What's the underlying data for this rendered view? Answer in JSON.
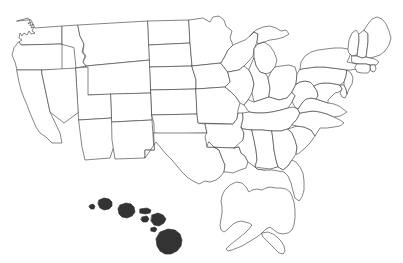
{
  "map": {
    "title": "United States Choropleth Map",
    "projection": "albers-usa",
    "background_color": "#ffffff",
    "border_color": "#3a3a3a",
    "default_fill": "#ffffff",
    "legend_visible": false,
    "labels_visible": false,
    "shade_levels": {
      "none": "#ffffff",
      "gray": "#999999",
      "dark": "#333333"
    },
    "highlighted_states": [
      {
        "code": "HI",
        "name": "Hawaii",
        "shade": "dark"
      },
      {
        "code": "NH",
        "name": "New Hampshire",
        "shade": "dark"
      },
      {
        "code": "WV",
        "name": "West Virginia",
        "shade": "gray"
      },
      {
        "code": "TN",
        "name": "Tennessee",
        "shade": "gray"
      },
      {
        "code": "AR",
        "name": "Arkansas",
        "shade": "gray"
      }
    ],
    "states": [
      {
        "code": "WA",
        "name": "Washington",
        "shade": "none"
      },
      {
        "code": "OR",
        "name": "Oregon",
        "shade": "none"
      },
      {
        "code": "CA",
        "name": "California",
        "shade": "none"
      },
      {
        "code": "NV",
        "name": "Nevada",
        "shade": "none"
      },
      {
        "code": "ID",
        "name": "Idaho",
        "shade": "none"
      },
      {
        "code": "MT",
        "name": "Montana",
        "shade": "none"
      },
      {
        "code": "WY",
        "name": "Wyoming",
        "shade": "none"
      },
      {
        "code": "UT",
        "name": "Utah",
        "shade": "none"
      },
      {
        "code": "AZ",
        "name": "Arizona",
        "shade": "none"
      },
      {
        "code": "CO",
        "name": "Colorado",
        "shade": "none"
      },
      {
        "code": "NM",
        "name": "New Mexico",
        "shade": "none"
      },
      {
        "code": "ND",
        "name": "North Dakota",
        "shade": "none"
      },
      {
        "code": "SD",
        "name": "South Dakota",
        "shade": "none"
      },
      {
        "code": "NE",
        "name": "Nebraska",
        "shade": "none"
      },
      {
        "code": "KS",
        "name": "Kansas",
        "shade": "none"
      },
      {
        "code": "OK",
        "name": "Oklahoma",
        "shade": "none"
      },
      {
        "code": "TX",
        "name": "Texas",
        "shade": "none"
      },
      {
        "code": "MN",
        "name": "Minnesota",
        "shade": "none"
      },
      {
        "code": "IA",
        "name": "Iowa",
        "shade": "none"
      },
      {
        "code": "MO",
        "name": "Missouri",
        "shade": "none"
      },
      {
        "code": "AR",
        "name": "Arkansas",
        "shade": "gray"
      },
      {
        "code": "LA",
        "name": "Louisiana",
        "shade": "none"
      },
      {
        "code": "WI",
        "name": "Wisconsin",
        "shade": "none"
      },
      {
        "code": "IL",
        "name": "Illinois",
        "shade": "none"
      },
      {
        "code": "MI",
        "name": "Michigan",
        "shade": "none"
      },
      {
        "code": "IN",
        "name": "Indiana",
        "shade": "none"
      },
      {
        "code": "OH",
        "name": "Ohio",
        "shade": "none"
      },
      {
        "code": "KY",
        "name": "Kentucky",
        "shade": "none"
      },
      {
        "code": "TN",
        "name": "Tennessee",
        "shade": "gray"
      },
      {
        "code": "MS",
        "name": "Mississippi",
        "shade": "none"
      },
      {
        "code": "AL",
        "name": "Alabama",
        "shade": "none"
      },
      {
        "code": "GA",
        "name": "Georgia",
        "shade": "none"
      },
      {
        "code": "FL",
        "name": "Florida",
        "shade": "none"
      },
      {
        "code": "SC",
        "name": "South Carolina",
        "shade": "none"
      },
      {
        "code": "NC",
        "name": "North Carolina",
        "shade": "none"
      },
      {
        "code": "VA",
        "name": "Virginia",
        "shade": "none"
      },
      {
        "code": "WV",
        "name": "West Virginia",
        "shade": "gray"
      },
      {
        "code": "MD",
        "name": "Maryland",
        "shade": "none"
      },
      {
        "code": "DE",
        "name": "Delaware",
        "shade": "none"
      },
      {
        "code": "PA",
        "name": "Pennsylvania",
        "shade": "none"
      },
      {
        "code": "NJ",
        "name": "New Jersey",
        "shade": "none"
      },
      {
        "code": "NY",
        "name": "New York",
        "shade": "none"
      },
      {
        "code": "CT",
        "name": "Connecticut",
        "shade": "none"
      },
      {
        "code": "RI",
        "name": "Rhode Island",
        "shade": "none"
      },
      {
        "code": "MA",
        "name": "Massachusetts",
        "shade": "none"
      },
      {
        "code": "VT",
        "name": "Vermont",
        "shade": "none"
      },
      {
        "code": "NH",
        "name": "New Hampshire",
        "shade": "dark"
      },
      {
        "code": "ME",
        "name": "Maine",
        "shade": "none"
      },
      {
        "code": "AK",
        "name": "Alaska",
        "shade": "none"
      },
      {
        "code": "HI",
        "name": "Hawaii",
        "shade": "dark"
      }
    ]
  }
}
